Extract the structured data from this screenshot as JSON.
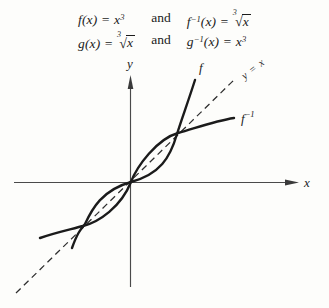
{
  "figure": {
    "background": "#fdfdfb",
    "ink_color": "#1b1b1b",
    "axis_color": "#4a4a4a"
  },
  "header": {
    "rows": [
      {
        "left": {
          "lhs": "f(x) = ",
          "rhs_base": "x",
          "rhs_sup": "3"
        },
        "conj": "and",
        "right": {
          "fname": "f",
          "fsup": "−1",
          "args": "(x) = ",
          "root_index": "3",
          "radical": "√",
          "radicand": "x"
        }
      },
      {
        "left": {
          "lhs": "g(x) = ",
          "root_index": "3",
          "radical": "√",
          "radicand": "x"
        },
        "conj": "and",
        "right": {
          "fname": "g",
          "fsup": "−1",
          "args": "(x) = ",
          "rhs_base": "x",
          "rhs_sup": "3"
        }
      }
    ]
  },
  "graph": {
    "x_axis_label": "x",
    "y_axis_label": "y",
    "f_label": "f",
    "f_inverse_label": {
      "base": "f",
      "sup": "−1"
    },
    "identity_label": "y = x",
    "curves": [
      {
        "name": "f",
        "function": "y = x^3",
        "style": "solid"
      },
      {
        "name": "f-inverse",
        "function": "y = x^(1/3)",
        "style": "solid"
      },
      {
        "name": "identity",
        "function": "y = x",
        "style": "dashed"
      }
    ],
    "intersections_with_identity": [
      [
        -1,
        -1
      ],
      [
        0,
        0
      ],
      [
        1,
        1
      ]
    ]
  }
}
